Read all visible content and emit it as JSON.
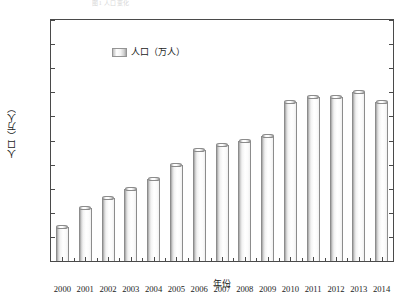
{
  "top_caption": "图1 人口变化",
  "chart_data": {
    "type": "bar",
    "title": "",
    "xlabel": "年份",
    "ylabel": "人口（万人）",
    "categories": [
      "2000",
      "2001",
      "2002",
      "2003",
      "2004",
      "2005",
      "2006",
      "2007",
      "2008",
      "2009",
      "2010",
      "2011",
      "2012",
      "2013",
      "2014"
    ],
    "values": [
      3807,
      3811,
      3813,
      3815,
      3817,
      3820,
      3823,
      3824,
      3825,
      3826,
      3833,
      3834,
      3834,
      3835,
      3833
    ],
    "series": [
      {
        "name": "人口（万人）",
        "values": [
          3807,
          3811,
          3813,
          3815,
          3817,
          3820,
          3823,
          3824,
          3825,
          3826,
          3833,
          3834,
          3834,
          3835,
          3833
        ]
      }
    ],
    "ylim": [
      3800,
      3850
    ],
    "ytick_step": 5,
    "ytick_labels": [
      "3 800",
      "3 805",
      "3 810",
      "3 815",
      "3 820",
      "3 825",
      "3 830",
      "3 835",
      "3 840",
      "3 845",
      "3 850"
    ],
    "ytick_values": [
      3800,
      3805,
      3810,
      3815,
      3820,
      3825,
      3830,
      3835,
      3840,
      3845,
      3850
    ],
    "grid": false,
    "legend": {
      "position": "top-left",
      "entries": [
        "人口（万人）"
      ]
    },
    "bar_color": "#d9d9d9",
    "frame_color": "#4a4a4a",
    "text_color": "#1b1b1b"
  }
}
